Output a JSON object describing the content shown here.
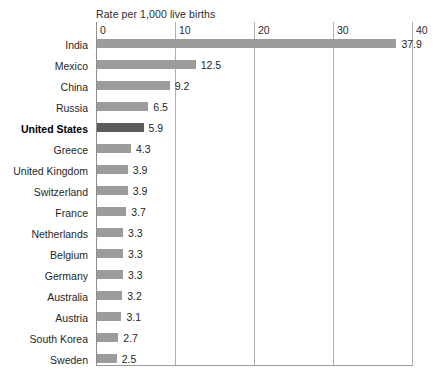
{
  "chart_data": {
    "type": "bar",
    "orientation": "horizontal",
    "title": "Rate per 1,000 live births",
    "xlabel": "",
    "ylabel": "",
    "xlim": [
      0,
      40
    ],
    "xticks": [
      "0",
      "10",
      "20",
      "30",
      "40"
    ],
    "grid": true,
    "legend": false,
    "categories": [
      "India",
      "Mexico",
      "China",
      "Russia",
      "United States",
      "Greece",
      "United Kingdom",
      "Switzerland",
      "France",
      "Netherlands",
      "Belgium",
      "Germany",
      "Australia",
      "Austria",
      "South Korea",
      "Sweden",
      "Japan"
    ],
    "values": [
      37.9,
      12.5,
      9.2,
      6.5,
      5.9,
      4.3,
      3.9,
      3.9,
      3.7,
      3.3,
      3.3,
      3.3,
      3.2,
      3.1,
      2.7,
      2.5,
      2.0
    ],
    "value_labels": [
      "37.9",
      "12.5",
      "9.2",
      "6.5",
      "5.9",
      "4.3",
      "3.9",
      "3.9",
      "3.7",
      "3.3",
      "3.3",
      "3.3",
      "3.2",
      "3.1",
      "2.7",
      "2.5",
      "2.0"
    ],
    "highlight_category": "United States",
    "colors": {
      "bar": "#9c9c9c",
      "bar_highlight": "#5c5c5c",
      "gridline": "#b0b0b0",
      "text": "#1f1f1f",
      "background": "#ffffff"
    }
  }
}
